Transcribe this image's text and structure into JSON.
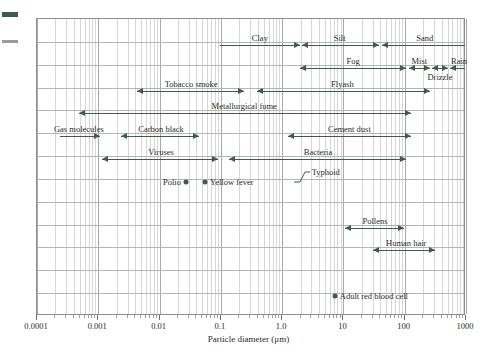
{
  "figure": {
    "axis_title": "Particle diameter (μm)",
    "accent_color": "#3d5c4e",
    "grid_color": "#b4b4b4",
    "frame_color": "#8d8d8d"
  },
  "chart_data": {
    "type": "range-bar",
    "title": "",
    "xlabel": "Particle diameter (μm)",
    "ylabel": "",
    "xscale": "log",
    "xlim": [
      0.0001,
      1000
    ],
    "xticks": [
      0.0001,
      0.001,
      0.01,
      0.1,
      1.0,
      10,
      100,
      1000
    ],
    "xticklabels": [
      "0.0001",
      "0.001",
      "0.01",
      "0.1",
      "1.0",
      "10",
      "100",
      "1000"
    ],
    "grid": true,
    "legend": "none",
    "ranges": [
      {
        "name": "Clay",
        "xmin": 0.1,
        "xmax": 2.0,
        "row": 0,
        "label_at": 0.45,
        "label_pos": "center",
        "left_cap": false,
        "right_cap": true
      },
      {
        "name": "Silt",
        "xmin": 2.2,
        "xmax": 40,
        "row": 0,
        "label_at": 9.0,
        "label_pos": "center",
        "left_cap": true,
        "right_cap": true
      },
      {
        "name": "Sand",
        "xmin": 45,
        "xmax": 1000,
        "row": 0,
        "label_at": 220,
        "label_pos": "center",
        "left_cap": true,
        "right_cap": false
      },
      {
        "name": "Fog",
        "xmin": 2.0,
        "xmax": 110,
        "row": 1,
        "label_at": 15,
        "label_pos": "center",
        "left_cap": true,
        "right_cap": true
      },
      {
        "name": "Mist",
        "xmin": 120,
        "xmax": 270,
        "row": 1,
        "label_at": 180,
        "label_pos": "center",
        "left_cap": true,
        "right_cap": true
      },
      {
        "name": "Drizzle",
        "xmin": 290,
        "xmax": 520,
        "row": 1,
        "label_at": 390,
        "label_pos": "below",
        "left_cap": true,
        "right_cap": true
      },
      {
        "name": "Rain",
        "xmin": 560,
        "xmax": 1000,
        "row": 1,
        "label_at": 800,
        "label_pos": "center",
        "left_cap": true,
        "right_cap": false
      },
      {
        "name": "Tobacco smoke",
        "xmin": 0.0045,
        "xmax": 0.25,
        "row": 2,
        "label_at": 0.034,
        "label_pos": "center",
        "left_cap": true,
        "right_cap": true
      },
      {
        "name": "Flyash",
        "xmin": 0.4,
        "xmax": 270,
        "row": 2,
        "label_at": 10,
        "label_pos": "center",
        "left_cap": true,
        "right_cap": true
      },
      {
        "name": "Metallurgical fume",
        "xmin": 0.0005,
        "xmax": 130,
        "row": 3,
        "label_at": 0.25,
        "label_pos": "center",
        "left_cap": true,
        "right_cap": true
      },
      {
        "name": "Gas molecules",
        "xmin": 0.00025,
        "xmax": 0.0011,
        "row": 4,
        "label_at": 0.0005,
        "label_pos": "center",
        "left_cap": false,
        "right_cap": true
      },
      {
        "name": "Carbon black",
        "xmin": 0.0024,
        "xmax": 0.045,
        "row": 4,
        "label_at": 0.011,
        "label_pos": "center",
        "left_cap": true,
        "right_cap": true
      },
      {
        "name": "Cement dust",
        "xmin": 1.3,
        "xmax": 130,
        "row": 4,
        "label_at": 13,
        "label_pos": "center",
        "left_cap": true,
        "right_cap": true
      },
      {
        "name": "Viruses",
        "xmin": 0.0012,
        "xmax": 0.095,
        "row": 5,
        "label_at": 0.011,
        "label_pos": "center",
        "left_cap": true,
        "right_cap": true
      },
      {
        "name": "Bacteria",
        "xmin": 0.14,
        "xmax": 110,
        "row": 5,
        "label_at": 4.0,
        "label_pos": "center",
        "left_cap": true,
        "right_cap": true
      },
      {
        "name": "Pollens",
        "xmin": 11,
        "xmax": 100,
        "row": 8,
        "label_at": 34,
        "label_pos": "center",
        "left_cap": true,
        "right_cap": true
      },
      {
        "name": "Human hair",
        "xmin": 32,
        "xmax": 330,
        "row": 9,
        "label_at": 110,
        "label_pos": "center",
        "left_cap": true,
        "right_cap": true
      }
    ],
    "points": [
      {
        "name": "Polio",
        "x": 0.028,
        "row": 6,
        "label_side": "left"
      },
      {
        "name": "Yellow fever",
        "x": 0.057,
        "row": 6,
        "label_side": "right"
      },
      {
        "name": "Adult red blood cell",
        "x": 7.5,
        "row": 11,
        "label_side": "right"
      }
    ],
    "annotations": [
      {
        "name": "Typhoid",
        "x": 1.6,
        "row": 6,
        "style": "leader-line"
      }
    ]
  }
}
